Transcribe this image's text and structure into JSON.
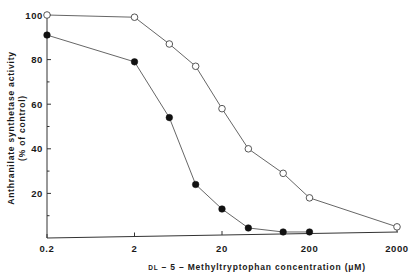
{
  "chart_data": {
    "type": "line",
    "title": "",
    "xlabel_prefix": "DL",
    "xlabel": " – 5 – Methyltryptophan concentration (μM)",
    "ylabel_line1": "Anthranilate synthetase activity",
    "ylabel_line2": "(% of control)",
    "xscale": "log",
    "xlim": [
      0.2,
      2000
    ],
    "ylim": [
      0,
      100
    ],
    "x_ticks": [
      0.2,
      2,
      20,
      200,
      2000
    ],
    "x_tick_labels": [
      "0.2",
      "2",
      "20",
      "200",
      "2000"
    ],
    "y_ticks": [
      20,
      40,
      60,
      80,
      100
    ],
    "y_tick_labels": [
      "20",
      "40",
      "60",
      "80",
      "100"
    ],
    "y_minor_ticks": [
      10,
      30,
      50,
      70,
      90
    ],
    "grid": false,
    "legend": null,
    "series": [
      {
        "name": "open circles",
        "marker": "open-circle",
        "x": [
          0.2,
          2,
          5,
          10,
          20,
          40,
          100,
          200,
          2000
        ],
        "values": [
          100,
          99,
          87,
          77,
          58,
          40,
          29,
          18,
          5
        ]
      },
      {
        "name": "filled circles",
        "marker": "filled-circle",
        "x": [
          0.2,
          2,
          5,
          10,
          20,
          40,
          100,
          200
        ],
        "values": [
          91,
          79,
          54,
          24,
          13,
          4.5,
          2.7,
          2.7
        ]
      }
    ]
  },
  "colors": {
    "axis": "#333333",
    "line": "#555555",
    "marker_fill_filled": "#111111",
    "marker_fill_open": "#ffffff",
    "text": "#1a1a1a"
  }
}
